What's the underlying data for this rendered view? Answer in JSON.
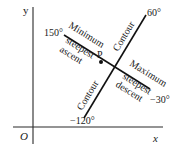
{
  "diagram": {
    "axes": {
      "y_label": "y",
      "x_label": "x",
      "origin_label": "O"
    },
    "point": {
      "label": "P"
    },
    "contour_line": {
      "label_upper": "Contour",
      "label_lower": "Contour",
      "angle_upper": "60°",
      "angle_lower": "−120°"
    },
    "steepest_line": {
      "upper_label_1": "Minimum",
      "upper_label_2": "steepest",
      "upper_label_3": "ascent",
      "lower_label_1": "Maximum",
      "lower_label_2": "steepest",
      "lower_label_3": "descent",
      "angle_upper": "150°",
      "angle_lower": "−30°"
    },
    "colors": {
      "ink": "#111111",
      "background": "#ffffff"
    }
  }
}
